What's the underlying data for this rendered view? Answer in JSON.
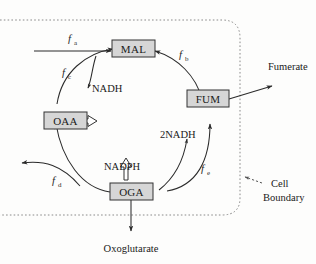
{
  "diagram": {
    "title_text": "",
    "nodes": [
      {
        "id": "mal",
        "label": "MAL"
      },
      {
        "id": "fum",
        "label": "FUM"
      },
      {
        "id": "oga",
        "label": "OGA"
      },
      {
        "id": "oaa",
        "label": "OAA"
      }
    ],
    "cofactors": [
      {
        "id": "nadh",
        "label": "NADH"
      },
      {
        "id": "two_nadh",
        "label": "2NADH"
      },
      {
        "id": "nadph",
        "label": "NADPH"
      }
    ],
    "fluxes": [
      {
        "id": "fa",
        "base": "f",
        "sub": "a"
      },
      {
        "id": "fb",
        "base": "f",
        "sub": "b"
      },
      {
        "id": "fc",
        "base": "f",
        "sub": "c"
      },
      {
        "id": "fd",
        "base": "f",
        "sub": "d"
      },
      {
        "id": "fe",
        "base": "f",
        "sub": "e"
      }
    ],
    "external": [
      {
        "id": "fumerate",
        "label": "Fumerate"
      },
      {
        "id": "oxoglutarate",
        "label": "Oxoglutarate"
      }
    ],
    "annotations": [
      {
        "id": "cell-boundary",
        "line1": "Cell",
        "line2": "Boundary"
      }
    ],
    "colors": {
      "node_fill": "#d6d6d6",
      "node_stroke": "#333333",
      "arrow": "#2b2b2b",
      "boundary": "#8a8a8a",
      "text": "#1a1a1a",
      "background": "#fdfdfc"
    }
  }
}
